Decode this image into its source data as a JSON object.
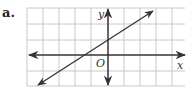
{
  "problem_label": "a.",
  "axes": {
    "x_label": "x",
    "y_label": "y",
    "origin_label": "O"
  },
  "grid": {
    "cell_px": 16,
    "x_range": [
      -5,
      4.8
    ],
    "y_range": [
      -2,
      3
    ],
    "line_color": "#c8c8c8"
  },
  "line": {
    "equation": "y = (2/3)x + 1",
    "slope": 0.6667,
    "y_intercept": 1,
    "x_intercept": -1.5,
    "color": "#333333"
  }
}
